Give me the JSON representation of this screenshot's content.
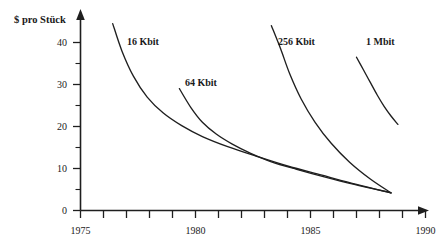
{
  "chart_data": {
    "type": "line",
    "title": "",
    "subtitle": "",
    "xlabel": "",
    "ylabel": "$ pro Stück",
    "xlim": [
      1975,
      1990
    ],
    "ylim": [
      0,
      45
    ],
    "grid": false,
    "legend_position": "inline-annotations",
    "x_ticks": [
      1975,
      1976,
      1977,
      1978,
      1979,
      1980,
      1981,
      1982,
      1983,
      1984,
      1985,
      1986,
      1987,
      1988,
      1989,
      1990
    ],
    "x_tick_labels": [
      "1975",
      "",
      "",
      "",
      "",
      "1980",
      "",
      "",
      "",
      "",
      "1985",
      "",
      "",
      "",
      "",
      "1990"
    ],
    "y_ticks": [
      0,
      5,
      10,
      15,
      20,
      25,
      30,
      35,
      40
    ],
    "y_tick_labels": [
      "0",
      "",
      "10",
      "",
      "20",
      "",
      "30",
      "",
      "40"
    ],
    "series": [
      {
        "name": "16 Kbit",
        "label_x": 1977.6,
        "label_y": 41.5,
        "x": [
          1976.4,
          1976.8,
          1977.3,
          1977.9,
          1978.6,
          1979.4,
          1980.3,
          1981.4,
          1982.6,
          1984.0,
          1985.5,
          1987.0,
          1988.5
        ],
        "y": [
          44.5,
          38.0,
          32.0,
          27.0,
          23.2,
          20.2,
          17.6,
          15.2,
          13.0,
          10.6,
          8.4,
          6.2,
          4.2
        ]
      },
      {
        "name": "64 Kbit",
        "label_x": 1980.5,
        "label_y": 32.0,
        "x": [
          1979.3,
          1979.8,
          1980.3,
          1980.9,
          1981.6,
          1982.4,
          1983.3,
          1984.4,
          1985.6,
          1986.9,
          1988.5
        ],
        "y": [
          29.0,
          24.5,
          21.0,
          18.2,
          15.8,
          13.6,
          11.6,
          9.8,
          8.0,
          6.2,
          4.2
        ]
      },
      {
        "name": "256 Kbit",
        "label_x": 1984.4,
        "label_y": 41.5,
        "x": [
          1983.3,
          1983.7,
          1984.1,
          1984.6,
          1985.2,
          1985.9,
          1986.7,
          1987.6,
          1988.5
        ],
        "y": [
          44.0,
          38.5,
          32.5,
          26.5,
          21.0,
          16.0,
          11.5,
          7.5,
          4.2
        ]
      },
      {
        "name": "1 Mbit",
        "label_x": 1987.2,
        "label_y": 41.5,
        "x": [
          1987.0,
          1987.3,
          1987.6,
          1987.9,
          1988.2,
          1988.5,
          1988.8
        ],
        "y": [
          36.5,
          33.5,
          30.5,
          27.5,
          24.8,
          22.5,
          20.5
        ]
      }
    ]
  },
  "axes": {
    "y_label": "$ pro Stück",
    "y_tick_texts": [
      "40",
      "30",
      "20",
      "10",
      "0"
    ],
    "x_tick_texts": [
      "1975",
      "1980",
      "1985",
      "1990"
    ]
  },
  "labels": {
    "series_0": "16 Kbit",
    "series_1": "64 Kbit",
    "series_2": "256 Kbit",
    "series_3": "1 Mbit"
  }
}
